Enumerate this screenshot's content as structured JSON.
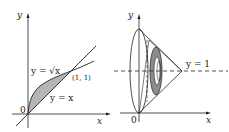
{
  "left_figure": {
    "axis_x_label": "x",
    "axis_y_label": "y",
    "origin_label": "0",
    "curve_sqrt_label": "y = √x",
    "line_label": "y = x",
    "intersection_label": "(1, 1)",
    "shade_color": "#b5b5b5",
    "stroke_color": "#222222"
  },
  "right_figure": {
    "axis_x_label": "x",
    "axis_y_label": "y",
    "origin_label": "0",
    "axis_of_rotation_label": "y = 1",
    "washer_color": "#8c8c8c",
    "stroke_color": "#222222"
  }
}
